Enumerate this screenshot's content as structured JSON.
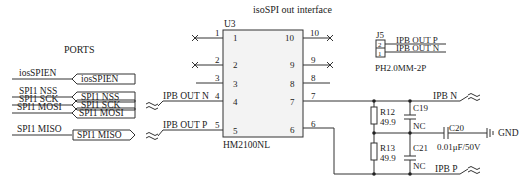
{
  "title": "isoSPI out interface",
  "ports": {
    "heading": "PORTS",
    "items": [
      {
        "net": "iosSPIEN",
        "port": "iosSPIEN",
        "dir": "in"
      },
      {
        "net": "SPI1 NSS",
        "port": "SPI1 NSS",
        "dir": "in"
      },
      {
        "net": "SPI1 SCK",
        "port": "SPI1 SCK",
        "dir": "in"
      },
      {
        "net": "SPI1 MOSI",
        "port": "SPI1 MOSI",
        "dir": "in"
      },
      {
        "net": "SPI1 MISO",
        "port": "SPI1 MISO",
        "dir": "out"
      }
    ]
  },
  "u3": {
    "ref": "U3",
    "part": "HM2100NL",
    "left_pins": [
      "1",
      "2",
      "3",
      "4",
      "5"
    ],
    "right_pins": [
      "10",
      "9",
      "8",
      "7",
      "6"
    ],
    "left_nets": {
      "4": "IPB OUT N",
      "5": "IPB OUT P"
    }
  },
  "j5": {
    "ref": "J5",
    "part": "PH2.0MM-2P",
    "pins": [
      "2",
      "1"
    ],
    "nets": [
      "IPB OUT P",
      "IPB OUT N"
    ]
  },
  "passives": {
    "r12": {
      "ref": "R12",
      "value": "49.9"
    },
    "r13": {
      "ref": "R13",
      "value": "49.9"
    },
    "c19": {
      "ref": "C19",
      "value": "NC"
    },
    "c21": {
      "ref": "C21",
      "value": "NC"
    },
    "c20": {
      "ref": "C20",
      "value": "0.01μF/50V"
    }
  },
  "nets": {
    "ipb_n": "IPB N",
    "ipb_p": "IPB P",
    "gnd": "GND"
  }
}
